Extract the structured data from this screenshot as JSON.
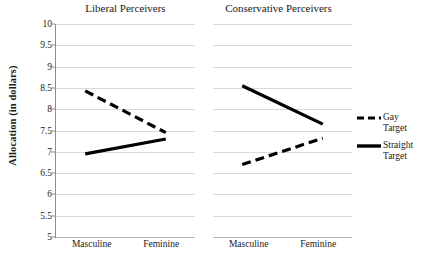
{
  "chart_data": {
    "type": "line",
    "title": "",
    "xlabel": "",
    "ylabel": "Allocation (in dollars)",
    "ylim": [
      5,
      10
    ],
    "ytick_values": [
      10,
      9.5,
      9,
      8.5,
      8,
      7.5,
      7,
      6.5,
      6,
      5.5,
      5
    ],
    "ytick_labels": [
      "10",
      "9.5",
      "9",
      "8.5",
      "8",
      "7.5",
      "7",
      "6.5",
      "6",
      "5.5",
      "5"
    ],
    "grid": true,
    "legend_position": "right",
    "categories": [
      "Masculine",
      "Feminine"
    ],
    "panels": [
      {
        "title": "Liberal Perceivers",
        "xtick_labels": [
          "Masculine",
          "Feminine"
        ],
        "series": [
          {
            "name": "Gay Target",
            "style": "dashed",
            "values": [
              8.43,
              7.45
            ]
          },
          {
            "name": "Straight Target",
            "style": "solid",
            "values": [
              6.95,
              7.3
            ]
          }
        ]
      },
      {
        "title": "Conservative Perceivers",
        "xtick_labels": [
          "Masculine",
          "Feminine"
        ],
        "series": [
          {
            "name": "Gay Target",
            "style": "dashed",
            "values": [
              6.7,
              7.32
            ]
          },
          {
            "name": "Straight Target",
            "style": "solid",
            "values": [
              8.55,
              7.65
            ]
          }
        ]
      }
    ],
    "legend": [
      {
        "label": "Gay Target",
        "label_line1": "Gay",
        "label_line2": "Target",
        "style": "dashed",
        "color": "#000000"
      },
      {
        "label": "Straight Target",
        "label_line1": "Straight",
        "label_line2": "Target",
        "style": "solid",
        "color": "#000000"
      }
    ],
    "colors": {
      "series_line": "#000000",
      "gridline": "#d9d9d9",
      "axis": "#8c8c8c",
      "background": "#ffffff",
      "text": "#1a1a1a"
    }
  }
}
